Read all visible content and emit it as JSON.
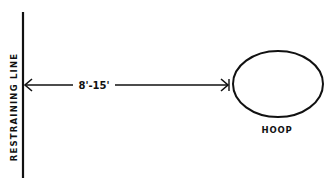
{
  "diagram": {
    "restraining_line_label": "RESTRAINING LINE",
    "distance_label": "8'-15'",
    "target_label": "HOOP",
    "colors": {
      "ink": "#111111",
      "background": "#ffffff"
    }
  }
}
